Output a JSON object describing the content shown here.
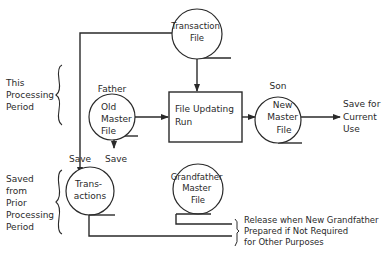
{
  "diagram": {
    "type": "flowchart",
    "period_labels": {
      "this_period": [
        "This",
        "Processing",
        "Period"
      ],
      "prior_period": [
        "Saved",
        "from",
        "Prior",
        "Processing",
        "Period"
      ]
    },
    "nodes": {
      "transaction_file": {
        "shape": "circle",
        "lines": [
          "Transaction",
          "File"
        ]
      },
      "old_master": {
        "shape": "circle",
        "role": "Father",
        "lines": [
          "Old",
          "Master",
          "File"
        ]
      },
      "update_run": {
        "shape": "box",
        "lines": [
          "File Updating",
          "Run"
        ]
      },
      "new_master": {
        "shape": "circle",
        "role": "Son",
        "lines": [
          "New",
          "Master",
          "File"
        ]
      },
      "transactions_saved": {
        "shape": "circle",
        "lines": [
          "Trans-",
          "actions"
        ]
      },
      "grandfather": {
        "shape": "circle",
        "lines": [
          "Grandfather",
          "Master",
          "File"
        ]
      }
    },
    "edge_labels": {
      "save_transactions": "Save",
      "save_old_master": "Save",
      "save_current": [
        "Save for",
        "Current",
        "Use"
      ],
      "release": [
        "Release when New Grandfather",
        "Prepared if Not Required",
        "for Other Purposes"
      ]
    },
    "edges": [
      {
        "from": "transaction_file",
        "to": "update_run"
      },
      {
        "from": "transaction_file",
        "to": "transactions_saved",
        "label": "Save"
      },
      {
        "from": "old_master",
        "to": "update_run"
      },
      {
        "from": "old_master",
        "to": "grandfather",
        "label": "Save"
      },
      {
        "from": "update_run",
        "to": "new_master"
      },
      {
        "from": "new_master",
        "to": "save_current"
      },
      {
        "from": "transactions_saved",
        "to": "release"
      },
      {
        "from": "grandfather",
        "to": "release"
      }
    ]
  }
}
